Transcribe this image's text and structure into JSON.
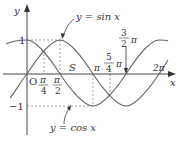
{
  "diagram": {
    "axes": {
      "x_label": "x",
      "y_label": "y",
      "origin_label": "O",
      "y_ticks": [
        {
          "value": 1,
          "label": "1"
        },
        {
          "value": -1,
          "label": "−1"
        }
      ],
      "x_ticks": [
        {
          "value": "pi/4",
          "num": "π",
          "den": "4"
        },
        {
          "value": "pi/2",
          "num": "π",
          "den": "2"
        },
        {
          "value": "pi",
          "label": "π"
        },
        {
          "value": "5pi/4",
          "num": "5",
          "den": "4",
          "suffix": "π"
        },
        {
          "value": "3pi/2",
          "num": "3",
          "den": "2",
          "suffix": "π"
        },
        {
          "value": "2pi",
          "label": "2π"
        }
      ]
    },
    "curves": [
      {
        "name": "sine",
        "label": "y = sin x",
        "color": "#555555"
      },
      {
        "name": "cosine",
        "label": "y = cos x",
        "color": "#555555"
      }
    ],
    "region_label": "S",
    "colors": {
      "axis": "#444444",
      "curve": "#666666",
      "guide": "#888888",
      "text": "#333333"
    }
  }
}
